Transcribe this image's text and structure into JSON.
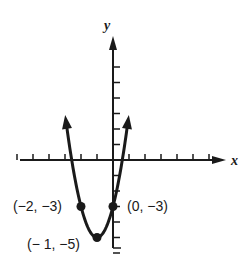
{
  "chart_data": {
    "type": "line",
    "title": "",
    "xlabel": "x",
    "ylabel": "y",
    "function": "y = 2x^2 + 4x - 3",
    "coefficients": {
      "a": 2,
      "b": 4,
      "c": -3
    },
    "x_range_drawn": [
      -2.94,
      0.94
    ],
    "xlim": [
      -6,
      7
    ],
    "ylim": [
      -6,
      8
    ],
    "x_ticks": [
      -6,
      -5,
      -4,
      -3,
      -2,
      -1,
      1,
      2,
      3,
      4,
      5,
      6
    ],
    "y_ticks": [
      -6,
      -5,
      -4,
      -3,
      -2,
      -1,
      1,
      2,
      3,
      4,
      5,
      6
    ],
    "tick_labels_shown": false,
    "grid": false,
    "curve_arrows": true,
    "points": [
      {
        "x": -2,
        "y": -3,
        "label": "(−2, −3)"
      },
      {
        "x": 0,
        "y": -3,
        "label": "(0, −3)"
      },
      {
        "x": -1,
        "y": -5,
        "label": "(− 1, −5)"
      }
    ],
    "vertex": {
      "x": -1,
      "y": -5
    },
    "colors": {
      "ink": "#1a1a1a",
      "background": "#ffffff"
    }
  },
  "labels": {
    "x_axis": "x",
    "y_axis": "y",
    "point_a": "(−2, −3)",
    "point_b": "(0, −3)",
    "point_vertex": "(− 1, −5)"
  }
}
